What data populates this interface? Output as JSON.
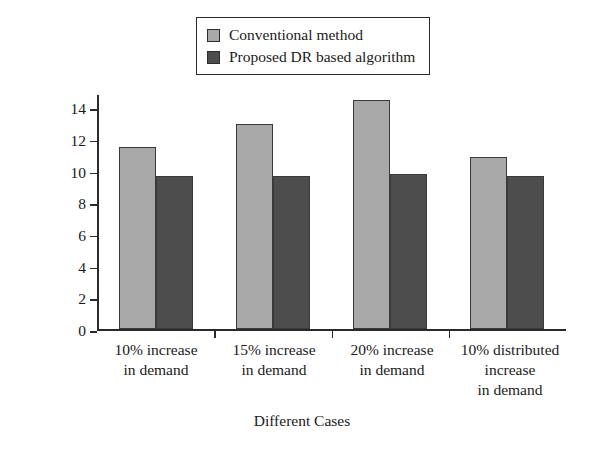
{
  "chart_data": {
    "type": "bar",
    "title": "",
    "xlabel": "Different Cases",
    "ylabel": "System Losses in MW",
    "categories": [
      "10% increase in demand",
      "15% increase in demand",
      "20% increase in demand",
      "10% distributed increase in demand"
    ],
    "category_lines": [
      [
        "10% increase",
        "in demand"
      ],
      [
        "15% increase",
        "in demand"
      ],
      [
        "20% increase",
        "in demand"
      ],
      [
        "10% distributed",
        "increase",
        "in demand"
      ]
    ],
    "series": [
      {
        "name": "Conventional method",
        "color": "#a8a8a8",
        "values": [
          11.5,
          13.0,
          14.5,
          10.9
        ]
      },
      {
        "name": "Proposed DR based algorithm",
        "color": "#4d4d4d",
        "values": [
          9.7,
          9.7,
          9.8,
          9.7
        ]
      }
    ],
    "ylim": [
      0,
      14.9
    ],
    "yticks": [
      0,
      2,
      4,
      6,
      8,
      10,
      12,
      14
    ],
    "ytick_labels": [
      "0",
      "2",
      "4",
      "6",
      "8",
      "10",
      "12",
      "14"
    ],
    "grid": false,
    "legend_position": "top-center",
    "axis_color": "#2a2a2a"
  }
}
